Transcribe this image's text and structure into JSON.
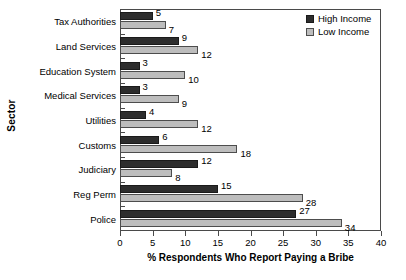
{
  "chart_data": {
    "type": "bar",
    "orientation": "horizontal",
    "title": "",
    "xlabel": "% Respondents Who Report Paying a Bribe",
    "ylabel": "Sector",
    "xlim": [
      0,
      40
    ],
    "xticks": [
      0,
      5,
      10,
      15,
      20,
      25,
      30,
      35,
      40
    ],
    "grid": false,
    "legend_position": "top-right",
    "categories": [
      "Tax Authorities",
      "Land Services",
      "Education System",
      "Medical Services",
      "Utilities",
      "Customs",
      "Judiciary",
      "Reg Perm",
      "Police"
    ],
    "series": [
      {
        "name": "High Income",
        "color": "#2d2d2d",
        "values": [
          5,
          9,
          3,
          3,
          4,
          6,
          12,
          15,
          27
        ]
      },
      {
        "name": "Low Income",
        "color": "#bdbdbd",
        "values": [
          7,
          12,
          10,
          9,
          12,
          18,
          8,
          28,
          34
        ]
      }
    ]
  },
  "legend": {
    "items": [
      {
        "label": "High Income",
        "swatch": "high"
      },
      {
        "label": "Low Income",
        "swatch": "low"
      }
    ]
  }
}
